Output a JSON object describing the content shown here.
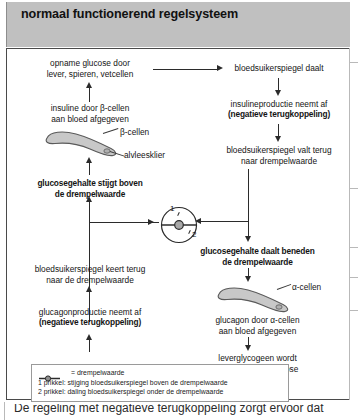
{
  "title": "normaal functionerend regelsysteem",
  "nodes": {
    "uptake": "opname glucose door\nlever, spieren, vetcellen",
    "insulin_release": "insuline door β-cellen\naan bloed afgegeven",
    "glucose_above": "glucosegehalte stijgt boven\nde drempelwaarde",
    "bs_falls": "bloedsuikerspiegel daalt",
    "insulin_prod_down_1": "insulineproductie neemt af",
    "insulin_prod_down_2": "(negatieve terugkoppeling)",
    "bs_back_to_threshold": "bloedsuikerspiegel valt terug\nnaar drempelwaarde",
    "glucose_below": "glucosegehalte daalt beneden\nde drempelwaarde",
    "glucagon_release": "glucagon door α-cellen\naan bloed afgegeven",
    "liver_glycogen": "leverglycogeen wordt\nomgezet naar glucose",
    "bs_rises": "bloedsuikerspiegel stijgt",
    "glucagon_prod_down_1": "glucagonproductie neemt af",
    "glucagon_prod_down_2": "(negatieve terugkoppeling)",
    "bs_returns": "bloedsuikerspiegel keert terug\nnaar de drempelwaarde"
  },
  "organ_labels": {
    "beta_cells": "β-cellen",
    "pancreas": "alvleesklier",
    "alpha_cells": "α-cellen"
  },
  "gauge": {
    "marker_1": "1",
    "marker_2": "2"
  },
  "legend": {
    "key_label": "= drempelwaarde",
    "item_1": "1  prikkel: stijging bloedsuikerspiegel boven de drempelwaarde",
    "item_2": "2  prikkel: daling bloedsuikerspiegel onder de drempelwaarde"
  },
  "caption": "De regeling met negatieve terugkoppeling zorgt ervoor dat",
  "colors": {
    "titlebar": "#c0c0c0",
    "organ_fill": "#c8c8c8",
    "organ_stroke": "#5a5a5a",
    "line": "#2b2b2b",
    "frame": "#4a4a4a"
  }
}
